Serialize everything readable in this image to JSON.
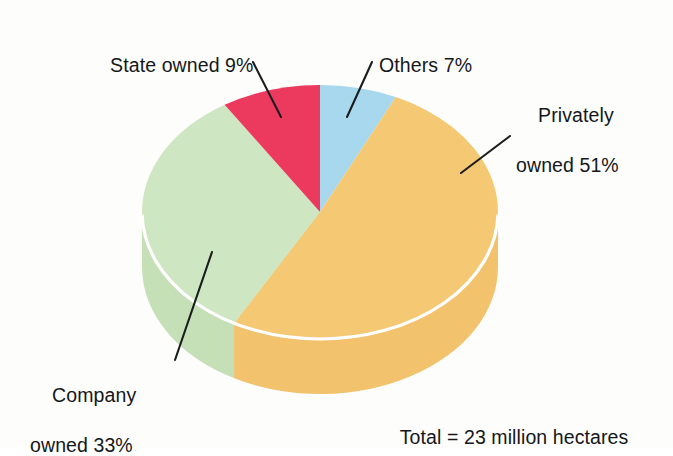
{
  "chart_data": {
    "type": "pie",
    "title": "",
    "subtitle": "",
    "xlabel": "",
    "ylabel": "",
    "legend_position": "none",
    "grid": false,
    "style": "3d-pie",
    "unit": "percent",
    "total_label": "Total = 23 million hectares",
    "total_value": 23,
    "total_unit": "million hectares",
    "categories": [
      "Others",
      "Privately owned",
      "Company owned",
      "State owned"
    ],
    "values": [
      7,
      51,
      33,
      9
    ],
    "start_angle_deg": 0,
    "direction": "clockwise",
    "slices": [
      {
        "name": "Others",
        "label": "Others 7%",
        "value": 7,
        "color": "#a8d8ee",
        "side_color": "#a8d8ee",
        "start_pct": 0,
        "end_pct": 7
      },
      {
        "name": "Privately owned",
        "label": "Privately owned 51%",
        "label_line1": "Privately",
        "label_line2": "owned 51%",
        "value": 51,
        "color": "#f5c874",
        "side_color": "#f3c26c",
        "start_pct": 7,
        "end_pct": 58
      },
      {
        "name": "Company owned",
        "label": "Company owned 33%",
        "label_line1": "Company",
        "label_line2": "owned 33%",
        "value": 33,
        "color": "#cfe6c2",
        "side_color": "#c5dfb7",
        "start_pct": 58,
        "end_pct": 91
      },
      {
        "name": "State owned",
        "label": "State owned 9%",
        "value": 9,
        "color": "#ec3a5e",
        "side_color": "#ec3a5e",
        "start_pct": 91,
        "end_pct": 100
      }
    ]
  },
  "labels": {
    "state": "State owned 9%",
    "others": "Others 7%",
    "privately_line1": "Privately",
    "privately_line2": "owned 51%",
    "company_line1": "Company",
    "company_line2": "owned 33%",
    "total": "Total = 23 million hectares"
  },
  "colors": {
    "background": "#fdfdfb",
    "text": "#15171a",
    "leader_line": "#1b1d1f",
    "rim_line": "#ffffff",
    "others": "#a8d8ee",
    "privately_owned": "#f5c874",
    "company_owned": "#cfe6c2",
    "state_owned": "#ec3a5e"
  }
}
